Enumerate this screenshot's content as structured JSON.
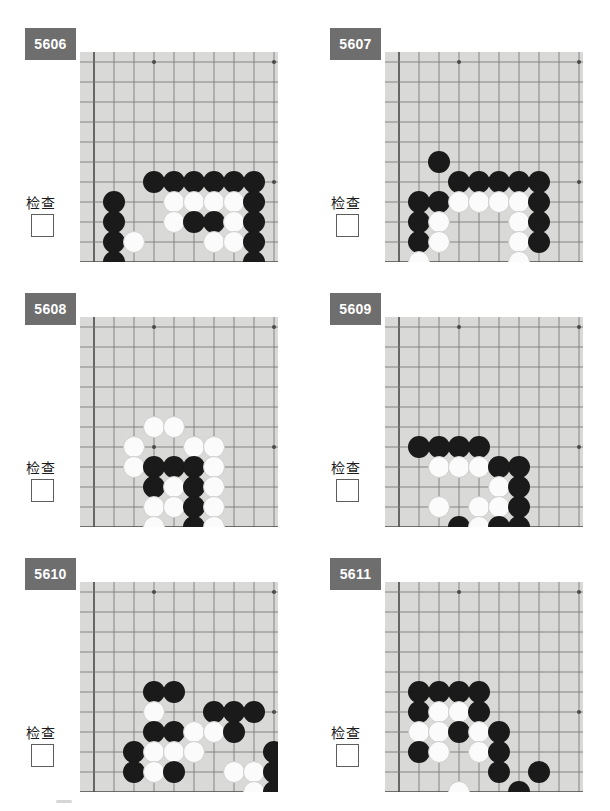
{
  "page": {
    "width": 610,
    "height": 811,
    "background": "#ffffff",
    "board_color": "#d9d9d7",
    "badge_color": "#6e6e6e",
    "line_color": "#7a7a7a",
    "edge_color": "#4a4a4a",
    "black_stone_color": "#1a1a1a",
    "white_stone_color": "#fbfbfb"
  },
  "board_geometry": {
    "cell": 20,
    "stone_diameter": 22,
    "origin_x": 14,
    "origin_y": 10,
    "cols": 10,
    "rows": 10,
    "description": "bottom-left corner of a Go board; column 0 is the left board edge, row 9 is the bottom board edge"
  },
  "problems": [
    {
      "id": "5606",
      "number": "5606",
      "check_label": "检查",
      "checkbox_checked": false,
      "stones": [
        {
          "c": 3,
          "r": 6,
          "color": "b"
        },
        {
          "c": 4,
          "r": 6,
          "color": "b"
        },
        {
          "c": 5,
          "r": 6,
          "color": "b"
        },
        {
          "c": 6,
          "r": 6,
          "color": "b"
        },
        {
          "c": 7,
          "r": 6,
          "color": "b"
        },
        {
          "c": 8,
          "r": 6,
          "color": "b"
        },
        {
          "c": 1,
          "r": 7,
          "color": "b"
        },
        {
          "c": 4,
          "r": 7,
          "color": "w"
        },
        {
          "c": 5,
          "r": 7,
          "color": "w"
        },
        {
          "c": 6,
          "r": 7,
          "color": "w"
        },
        {
          "c": 7,
          "r": 7,
          "color": "w"
        },
        {
          "c": 8,
          "r": 7,
          "color": "b"
        },
        {
          "c": 1,
          "r": 8,
          "color": "b"
        },
        {
          "c": 4,
          "r": 8,
          "color": "w"
        },
        {
          "c": 5,
          "r": 8,
          "color": "b"
        },
        {
          "c": 6,
          "r": 8,
          "color": "b"
        },
        {
          "c": 7,
          "r": 8,
          "color": "w"
        },
        {
          "c": 8,
          "r": 8,
          "color": "b"
        },
        {
          "c": 1,
          "r": 9,
          "color": "b"
        },
        {
          "c": 2,
          "r": 9,
          "color": "w"
        },
        {
          "c": 6,
          "r": 9,
          "color": "w"
        },
        {
          "c": 7,
          "r": 9,
          "color": "w"
        },
        {
          "c": 8,
          "r": 9,
          "color": "b"
        },
        {
          "c": 1,
          "r": 10,
          "color": "b"
        },
        {
          "c": 8,
          "r": 10,
          "color": "b"
        }
      ]
    },
    {
      "id": "5607",
      "number": "5607",
      "check_label": "检查",
      "checkbox_checked": false,
      "stones": [
        {
          "c": 2,
          "r": 5,
          "color": "b"
        },
        {
          "c": 3,
          "r": 6,
          "color": "b"
        },
        {
          "c": 4,
          "r": 6,
          "color": "b"
        },
        {
          "c": 5,
          "r": 6,
          "color": "b"
        },
        {
          "c": 6,
          "r": 6,
          "color": "b"
        },
        {
          "c": 7,
          "r": 6,
          "color": "b"
        },
        {
          "c": 1,
          "r": 7,
          "color": "b"
        },
        {
          "c": 2,
          "r": 7,
          "color": "b"
        },
        {
          "c": 3,
          "r": 7,
          "color": "w"
        },
        {
          "c": 4,
          "r": 7,
          "color": "w"
        },
        {
          "c": 5,
          "r": 7,
          "color": "w"
        },
        {
          "c": 6,
          "r": 7,
          "color": "w"
        },
        {
          "c": 7,
          "r": 7,
          "color": "b"
        },
        {
          "c": 1,
          "r": 8,
          "color": "b"
        },
        {
          "c": 2,
          "r": 8,
          "color": "w"
        },
        {
          "c": 6,
          "r": 8,
          "color": "w"
        },
        {
          "c": 7,
          "r": 8,
          "color": "b"
        },
        {
          "c": 1,
          "r": 9,
          "color": "b"
        },
        {
          "c": 2,
          "r": 9,
          "color": "w"
        },
        {
          "c": 6,
          "r": 9,
          "color": "w"
        },
        {
          "c": 7,
          "r": 9,
          "color": "b"
        },
        {
          "c": 10,
          "r": 9,
          "color": "b"
        },
        {
          "c": 1,
          "r": 10,
          "color": "w"
        },
        {
          "c": 6,
          "r": 10,
          "color": "w"
        }
      ]
    },
    {
      "id": "5608",
      "number": "5608",
      "check_label": "检查",
      "checkbox_checked": false,
      "stones": [
        {
          "c": 3,
          "r": 5,
          "color": "w"
        },
        {
          "c": 4,
          "r": 5,
          "color": "w"
        },
        {
          "c": 2,
          "r": 6,
          "color": "w"
        },
        {
          "c": 5,
          "r": 6,
          "color": "w"
        },
        {
          "c": 6,
          "r": 6,
          "color": "w"
        },
        {
          "c": 2,
          "r": 7,
          "color": "w"
        },
        {
          "c": 3,
          "r": 7,
          "color": "b"
        },
        {
          "c": 4,
          "r": 7,
          "color": "b"
        },
        {
          "c": 5,
          "r": 7,
          "color": "b"
        },
        {
          "c": 6,
          "r": 7,
          "color": "w"
        },
        {
          "c": 3,
          "r": 8,
          "color": "b"
        },
        {
          "c": 4,
          "r": 8,
          "color": "w"
        },
        {
          "c": 5,
          "r": 8,
          "color": "b"
        },
        {
          "c": 6,
          "r": 8,
          "color": "w"
        },
        {
          "c": 3,
          "r": 9,
          "color": "w"
        },
        {
          "c": 4,
          "r": 9,
          "color": "w"
        },
        {
          "c": 5,
          "r": 9,
          "color": "b"
        },
        {
          "c": 6,
          "r": 9,
          "color": "w"
        },
        {
          "c": 3,
          "r": 10,
          "color": "w"
        },
        {
          "c": 5,
          "r": 10,
          "color": "b"
        },
        {
          "c": 6,
          "r": 10,
          "color": "w"
        }
      ]
    },
    {
      "id": "5609",
      "number": "5609",
      "check_label": "检查",
      "checkbox_checked": false,
      "stones": [
        {
          "c": 1,
          "r": 6,
          "color": "b"
        },
        {
          "c": 2,
          "r": 6,
          "color": "b"
        },
        {
          "c": 3,
          "r": 6,
          "color": "b"
        },
        {
          "c": 4,
          "r": 6,
          "color": "b"
        },
        {
          "c": 2,
          "r": 7,
          "color": "w"
        },
        {
          "c": 3,
          "r": 7,
          "color": "w"
        },
        {
          "c": 4,
          "r": 7,
          "color": "w"
        },
        {
          "c": 5,
          "r": 7,
          "color": "b"
        },
        {
          "c": 6,
          "r": 7,
          "color": "b"
        },
        {
          "c": 5,
          "r": 8,
          "color": "w"
        },
        {
          "c": 6,
          "r": 8,
          "color": "b"
        },
        {
          "c": 2,
          "r": 9,
          "color": "w"
        },
        {
          "c": 4,
          "r": 9,
          "color": "w"
        },
        {
          "c": 5,
          "r": 9,
          "color": "w"
        },
        {
          "c": 6,
          "r": 9,
          "color": "b"
        },
        {
          "c": 3,
          "r": 10,
          "color": "b"
        },
        {
          "c": 4,
          "r": 10,
          "color": "w"
        },
        {
          "c": 5,
          "r": 10,
          "color": "b"
        },
        {
          "c": 6,
          "r": 10,
          "color": "b"
        }
      ]
    },
    {
      "id": "5610",
      "number": "5610",
      "check_label": "检查",
      "checkbox_checked": false,
      "stones": [
        {
          "c": 3,
          "r": 5,
          "color": "b"
        },
        {
          "c": 4,
          "r": 5,
          "color": "b"
        },
        {
          "c": 3,
          "r": 6,
          "color": "w"
        },
        {
          "c": 6,
          "r": 6,
          "color": "b"
        },
        {
          "c": 7,
          "r": 6,
          "color": "b"
        },
        {
          "c": 8,
          "r": 6,
          "color": "b"
        },
        {
          "c": 3,
          "r": 7,
          "color": "b"
        },
        {
          "c": 4,
          "r": 7,
          "color": "b"
        },
        {
          "c": 5,
          "r": 7,
          "color": "w"
        },
        {
          "c": 6,
          "r": 7,
          "color": "w"
        },
        {
          "c": 7,
          "r": 7,
          "color": "b"
        },
        {
          "c": 2,
          "r": 8,
          "color": "b"
        },
        {
          "c": 3,
          "r": 8,
          "color": "w"
        },
        {
          "c": 4,
          "r": 8,
          "color": "w"
        },
        {
          "c": 5,
          "r": 8,
          "color": "w"
        },
        {
          "c": 9,
          "r": 8,
          "color": "b"
        },
        {
          "c": 2,
          "r": 9,
          "color": "b"
        },
        {
          "c": 3,
          "r": 9,
          "color": "w"
        },
        {
          "c": 4,
          "r": 9,
          "color": "b"
        },
        {
          "c": 7,
          "r": 9,
          "color": "w"
        },
        {
          "c": 8,
          "r": 9,
          "color": "w"
        },
        {
          "c": 9,
          "r": 9,
          "color": "b"
        },
        {
          "c": 8,
          "r": 10,
          "color": "w"
        },
        {
          "c": 9,
          "r": 10,
          "color": "b"
        }
      ]
    },
    {
      "id": "5611",
      "number": "5611",
      "check_label": "检查",
      "checkbox_checked": false,
      "stones": [
        {
          "c": 1,
          "r": 5,
          "color": "b"
        },
        {
          "c": 2,
          "r": 5,
          "color": "b"
        },
        {
          "c": 3,
          "r": 5,
          "color": "b"
        },
        {
          "c": 4,
          "r": 5,
          "color": "b"
        },
        {
          "c": 1,
          "r": 6,
          "color": "b"
        },
        {
          "c": 2,
          "r": 6,
          "color": "w"
        },
        {
          "c": 3,
          "r": 6,
          "color": "w"
        },
        {
          "c": 4,
          "r": 6,
          "color": "b"
        },
        {
          "c": 1,
          "r": 7,
          "color": "w"
        },
        {
          "c": 2,
          "r": 7,
          "color": "w"
        },
        {
          "c": 3,
          "r": 7,
          "color": "b"
        },
        {
          "c": 4,
          "r": 7,
          "color": "w"
        },
        {
          "c": 5,
          "r": 7,
          "color": "b"
        },
        {
          "c": 1,
          "r": 8,
          "color": "b"
        },
        {
          "c": 2,
          "r": 8,
          "color": "w"
        },
        {
          "c": 4,
          "r": 8,
          "color": "w"
        },
        {
          "c": 5,
          "r": 8,
          "color": "b"
        },
        {
          "c": 5,
          "r": 9,
          "color": "b"
        },
        {
          "c": 7,
          "r": 9,
          "color": "b"
        },
        {
          "c": 3,
          "r": 10,
          "color": "w"
        },
        {
          "c": 6,
          "r": 10,
          "color": "b"
        }
      ]
    }
  ]
}
